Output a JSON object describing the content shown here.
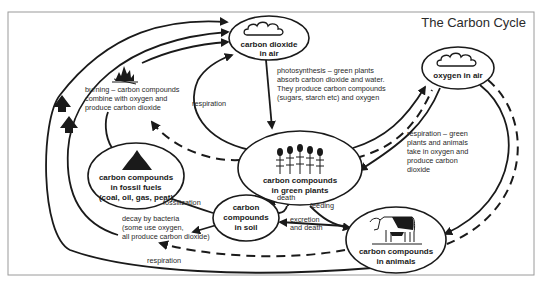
{
  "title": "The Carbon Cycle",
  "colors": {
    "ink": "#1a1a1a",
    "frame": "#9a9a9a",
    "background": "#ffffff"
  },
  "nodes": {
    "co2_air": {
      "line1": "carbon dioxide",
      "line2": "in air",
      "icon": "cloud-icon"
    },
    "oxygen_air": {
      "line1": "oxygen in air",
      "icon": "cloud-icon"
    },
    "green_plants": {
      "line1": "carbon compounds",
      "line2": "in green plants",
      "icon": "plants-icon"
    },
    "fossil_fuels": {
      "line1": "carbon compounds",
      "line2": "in fossil fuels",
      "line3": "(coal, oil, gas, peat)",
      "icon": "coal-pile-icon"
    },
    "soil": {
      "line1": "carbon",
      "line2": "compounds",
      "line3": "in soil"
    },
    "animals": {
      "line1": "carbon compounds",
      "line2": "in animals",
      "icon": "cow-icon"
    }
  },
  "annotations": {
    "burning": [
      "burning – carbon compounds",
      "combine with oxygen and",
      "produce carbon dioxide"
    ],
    "photosynthesis": [
      "photosynthesis – green plants",
      "absorb carbon dioxide and water.",
      "They produce carbon compounds",
      "(sugars, starch etc) and oxygen"
    ],
    "respiration_plants": "respiration",
    "respiration_green": [
      "respiration – green",
      "plants and animals",
      "take in oxygen and",
      "produce carbon",
      "dioxide"
    ],
    "death": "death",
    "feeding": "feeding",
    "fossilization": "fossilization",
    "decay": [
      "decay by bacteria",
      "(some use oxygen,",
      "all produce carbon dioxide)"
    ],
    "excretion": [
      "excretion",
      "and death"
    ],
    "respiration_animals": "respiration"
  }
}
